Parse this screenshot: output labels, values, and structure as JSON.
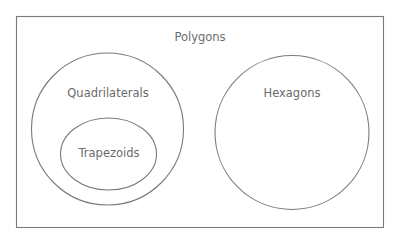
{
  "diagram": {
    "type": "venn-euler",
    "universe": {
      "label": "Polygons"
    },
    "sets": [
      {
        "id": "quadrilaterals",
        "label": "Quadrilaterals",
        "shape": "circle",
        "contains": [
          "trapezoids"
        ]
      },
      {
        "id": "trapezoids",
        "label": "Trapezoids",
        "shape": "ellipse",
        "subset_of": "quadrilaterals"
      },
      {
        "id": "hexagons",
        "label": "Hexagons",
        "shape": "circle",
        "contains": []
      }
    ],
    "colors": {
      "stroke": "#7a7a7a",
      "text": "#6b6b6b",
      "background": "#ffffff"
    }
  }
}
